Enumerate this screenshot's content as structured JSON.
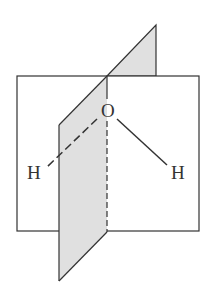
{
  "diagram": {
    "atoms": {
      "oxygen": "O",
      "hydrogen_left": "H",
      "hydrogen_right": "H"
    },
    "colors": {
      "line": "#333333",
      "plane_fill": "#e0e0e0",
      "background": "#ffffff"
    }
  }
}
